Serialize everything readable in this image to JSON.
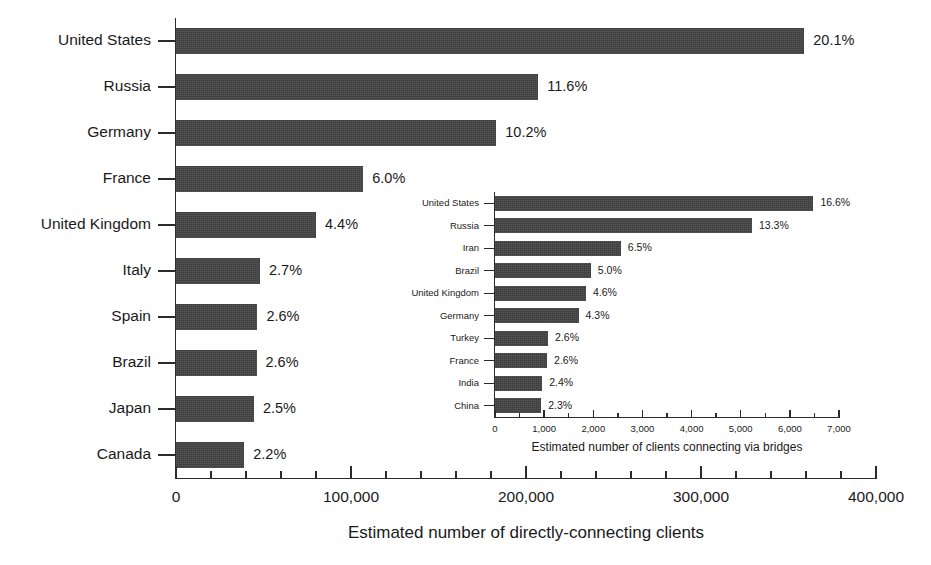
{
  "chart_data": [
    {
      "id": "main",
      "type": "bar",
      "orientation": "horizontal",
      "title": "",
      "xlabel": "Estimated number of directly-connecting clients",
      "ylabel": "",
      "xlim": [
        0,
        400000
      ],
      "xticks": [
        0,
        100000,
        200000,
        300000,
        400000
      ],
      "xticklabels": [
        "0",
        "100,000",
        "200,000",
        "300,000",
        "400,000"
      ],
      "minor_ticks_per_interval": 4,
      "grid": false,
      "legend": "none",
      "bar_color": "#3c3c3c",
      "categories": [
        "United States",
        "Russia",
        "Germany",
        "France",
        "United Kingdom",
        "Italy",
        "Spain",
        "Brazil",
        "Japan",
        "Canada"
      ],
      "values": [
        359000,
        207000,
        183000,
        107000,
        80000,
        48000,
        46500,
        46000,
        44500,
        39000
      ],
      "data_labels": [
        "20.1%",
        "11.6%",
        "10.2%",
        "6.0%",
        "4.4%",
        "2.7%",
        "2.6%",
        "2.6%",
        "2.5%",
        "2.2%"
      ]
    },
    {
      "id": "inset",
      "type": "bar",
      "orientation": "horizontal",
      "title": "",
      "xlabel": "Estimated number of clients connecting via bridges",
      "ylabel": "",
      "xlim": [
        0,
        7000
      ],
      "xticks": [
        0,
        1000,
        2000,
        3000,
        4000,
        5000,
        6000,
        7000
      ],
      "xticklabels": [
        "0",
        "1,000",
        "2,000",
        "3,000",
        "4,000",
        "5,000",
        "6,000",
        "7,000"
      ],
      "minor_ticks_per_interval": 1,
      "grid": false,
      "legend": "none",
      "bar_color": "#3c3c3c",
      "categories": [
        "United States",
        "Russia",
        "Iran",
        "Brazil",
        "United Kingdom",
        "Germany",
        "Turkey",
        "France",
        "India",
        "China"
      ],
      "values": [
        6480,
        5230,
        2560,
        1950,
        1850,
        1700,
        1080,
        1060,
        960,
        940
      ],
      "data_labels": [
        "16.6%",
        "13.3%",
        "6.5%",
        "5.0%",
        "4.6%",
        "4.3%",
        "2.6%",
        "2.6%",
        "2.4%",
        "2.3%"
      ]
    }
  ]
}
